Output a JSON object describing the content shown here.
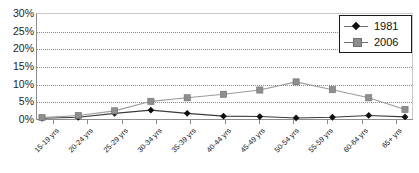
{
  "chart": {
    "title_partial": "",
    "axis": {
      "y_ticks": [
        "30%",
        "25%",
        "20%",
        "15%",
        "10%",
        "5%",
        "0%"
      ]
    },
    "legend": {
      "entries": [
        {
          "label": "1981",
          "marker": "diamond-marker",
          "color": "#101010"
        },
        {
          "label": "2006",
          "marker": "square-marker",
          "color": "#8e8e8e"
        }
      ]
    }
  },
  "chart_data": {
    "type": "line",
    "title": "",
    "xlabel": "",
    "ylabel": "",
    "ylim": [
      0,
      30
    ],
    "ytick_values": [
      0,
      5,
      10,
      15,
      20,
      25,
      30
    ],
    "ytick_labels": [
      "0%",
      "5%",
      "10%",
      "15%",
      "20%",
      "25%",
      "30%"
    ],
    "grid": true,
    "legend_position": "top-right",
    "categories": [
      "15-19 yrs",
      "20-24 yrs",
      "25-29 yrs",
      "30-34 yrs",
      "35-39 yrs",
      "40-44 yrs",
      "45-49 yrs",
      "50-54 yrs",
      "55-59 yrs",
      "60-64 yrs",
      "65+ yrs"
    ],
    "series": [
      {
        "name": "1981",
        "color": "#101010",
        "marker": "diamond",
        "values": [
          0.2,
          0.5,
          1.6,
          2.5,
          1.6,
          0.8,
          0.7,
          0.3,
          0.5,
          1.0,
          0.6
        ]
      },
      {
        "name": "2006",
        "color": "#8e8e8e",
        "marker": "square",
        "values": [
          0.4,
          1.0,
          2.3,
          5.0,
          6.0,
          7.0,
          8.2,
          10.5,
          8.3,
          6.0,
          2.7
        ]
      }
    ]
  }
}
